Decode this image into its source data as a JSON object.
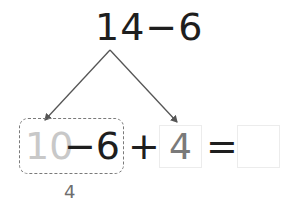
{
  "problem": {
    "expression": "14−6",
    "minuend": "14",
    "operator": "−",
    "subtrahend": "6"
  },
  "decomposition": {
    "left_part": "10",
    "left_operation": "−6",
    "plus": "+",
    "right_part": "4",
    "equals": "=",
    "answer": "",
    "intermediate_result": "4"
  },
  "colors": {
    "dark_text": "#1e1e1e",
    "faded_text": "#c8c8c8",
    "gray_text": "#7a7a7a",
    "arrow": "#555555",
    "dashed_border": "#7a7a7a",
    "box_border": "#ececec"
  }
}
